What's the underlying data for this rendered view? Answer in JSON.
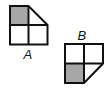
{
  "figures": [
    {
      "label": "A",
      "shaded_cell": "top-left",
      "cut_cell": "top-right",
      "cut": "diagonal from top-left of cell to middle of right edge"
    },
    {
      "label": "B",
      "shaded_cell": "bottom-left",
      "cut_cell": "bottom-right",
      "cut": "diagonal from middle of right edge to bottom-middle"
    }
  ],
  "colors": {
    "stroke": "#111111",
    "shade": "#a6a6a6",
    "background": "#ffffff"
  }
}
